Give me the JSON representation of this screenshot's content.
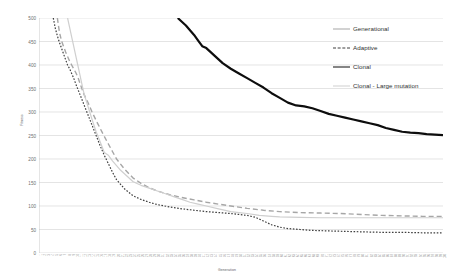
{
  "chart_data": {
    "type": "line",
    "title": "",
    "xlabel": "Generation",
    "ylabel": "Fitness",
    "ylim": [
      0,
      500
    ],
    "yticks": [
      0,
      50,
      100,
      150,
      200,
      250,
      300,
      350,
      400,
      450,
      500
    ],
    "xlim": [
      1,
      100
    ],
    "grid": true,
    "legend_position": "top-right",
    "colors": {
      "generational": "#a6a6a6",
      "adaptive": "#3f3f3f",
      "clonal": "#0d0d0d",
      "clonal_large_mutation": "#cfcfcf",
      "gridline": "#d9d9d9",
      "axis_text": "#6d6e70"
    },
    "xticks": [
      "1",
      "2",
      "3",
      "4",
      "5",
      "6",
      "7",
      "8",
      "9",
      "10",
      "11",
      "12",
      "13",
      "14",
      "15",
      "16",
      "17",
      "18",
      "19",
      "20",
      "21",
      "22",
      "23",
      "24",
      "25",
      "26",
      "27",
      "28",
      "29",
      "30",
      "31",
      "32",
      "33",
      "34",
      "35",
      "36",
      "37",
      "38",
      "39",
      "40",
      "41",
      "42",
      "43",
      "44",
      "45",
      "46",
      "47",
      "48",
      "49",
      "50",
      "51",
      "52",
      "53",
      "54",
      "55",
      "56",
      "57",
      "58",
      "59",
      "60",
      "61",
      "62",
      "63",
      "64",
      "65",
      "66",
      "67",
      "68",
      "69",
      "70",
      "71",
      "72",
      "73",
      "74",
      "75",
      "76",
      "77",
      "78",
      "79",
      "80",
      "81",
      "82",
      "83",
      "84",
      "85",
      "86",
      "87",
      "88",
      "89",
      "90",
      "91",
      "92",
      "93",
      "94",
      "95",
      "96",
      "97",
      "98",
      "99",
      "100"
    ],
    "series": [
      {
        "name": "Generational",
        "style": "long-dash",
        "color": "#a6a6a6",
        "width": 1.4,
        "x": [
          5.5,
          6,
          6.5,
          7,
          7.5,
          8,
          8.5,
          9,
          9.5,
          10,
          10.5,
          11,
          11.5,
          12,
          13,
          14,
          15,
          16,
          17,
          18,
          19,
          20,
          22,
          24,
          26,
          28,
          30,
          33,
          36,
          39,
          42,
          45,
          48,
          52,
          56,
          60,
          65,
          70,
          75,
          80,
          85,
          90,
          95,
          100
        ],
        "values": [
          500,
          470,
          452,
          440,
          428,
          418,
          408,
          400,
          392,
          384,
          375,
          362,
          350,
          338,
          320,
          300,
          282,
          265,
          248,
          232,
          216,
          200,
          178,
          160,
          148,
          139,
          132,
          124,
          118,
          113,
          108,
          104,
          100,
          95,
          91,
          88,
          86,
          85,
          84,
          82,
          80,
          79,
          78,
          78
        ]
      },
      {
        "name": "Adaptive",
        "style": "fine-dash",
        "color": "#3f3f3f",
        "width": 1.2,
        "x": [
          4.5,
          5,
          5.5,
          6,
          6.5,
          7,
          7.5,
          8,
          8.5,
          9,
          9.5,
          10,
          11,
          12,
          13,
          14,
          15,
          16,
          17,
          18,
          19,
          20,
          22,
          24,
          26,
          28,
          30,
          33,
          36,
          39,
          42,
          45,
          48,
          50,
          52,
          54,
          56,
          58,
          60,
          62,
          65,
          68,
          72,
          76,
          80,
          85,
          90,
          95,
          100
        ],
        "values": [
          500,
          478,
          462,
          448,
          436,
          424,
          412,
          400,
          392,
          382,
          372,
          360,
          338,
          316,
          294,
          272,
          250,
          228,
          208,
          190,
          172,
          156,
          136,
          122,
          114,
          108,
          103,
          98,
          94,
          91,
          88,
          86,
          84,
          82,
          80,
          76,
          68,
          60,
          55,
          52,
          50,
          48,
          47,
          46,
          45,
          44,
          44,
          43,
          43
        ]
      },
      {
        "name": "Clonal",
        "style": "solid-bold",
        "color": "#0d0d0d",
        "width": 2.2,
        "x": [
          35,
          36,
          37,
          38,
          39,
          40,
          41,
          42,
          43,
          44,
          45,
          46,
          48,
          50,
          52,
          54,
          56,
          58,
          60,
          62,
          64,
          66,
          68,
          70,
          72,
          74,
          76,
          78,
          80,
          82,
          84,
          86,
          88,
          90,
          92,
          94,
          96,
          98,
          100
        ],
        "values": [
          500,
          492,
          484,
          474,
          464,
          452,
          440,
          436,
          428,
          420,
          412,
          404,
          392,
          382,
          372,
          362,
          352,
          340,
          330,
          320,
          314,
          312,
          308,
          302,
          296,
          292,
          288,
          284,
          280,
          276,
          272,
          266,
          262,
          258,
          256,
          255,
          253,
          252,
          251
        ]
      },
      {
        "name": "Clonal - Large mutation",
        "style": "solid-thin",
        "color": "#cfcfcf",
        "width": 1.2,
        "x": [
          8,
          8.5,
          9,
          9.5,
          10,
          10.5,
          11,
          11.5,
          12,
          13,
          14,
          15,
          16,
          17,
          18,
          19,
          20,
          21,
          22,
          23,
          24,
          25,
          26,
          28,
          30,
          32,
          34,
          36,
          38,
          40,
          42,
          45,
          48,
          50,
          52,
          55,
          58,
          60,
          65,
          70,
          75,
          80,
          85,
          90,
          95,
          100
        ],
        "values": [
          500,
          480,
          460,
          440,
          420,
          400,
          380,
          360,
          340,
          312,
          284,
          258,
          236,
          214,
          208,
          196,
          186,
          176,
          168,
          160,
          152,
          148,
          144,
          138,
          132,
          126,
          120,
          114,
          108,
          104,
          100,
          94,
          88,
          86,
          84,
          80,
          78,
          77,
          76,
          75,
          75,
          75,
          75,
          75,
          75,
          75
        ]
      }
    ]
  },
  "legend": {
    "items": [
      {
        "label": "Generational"
      },
      {
        "label": "Adaptive"
      },
      {
        "label": "Clonal"
      },
      {
        "label": "Clonal - Large mutation"
      }
    ]
  },
  "axes": {
    "y_title": "Fitness",
    "x_title": "Generation"
  }
}
